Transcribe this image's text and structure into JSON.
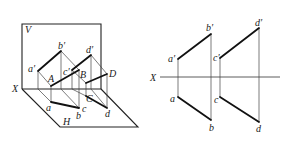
{
  "pictorial": {
    "plane_labels": {
      "V": "V",
      "H": "H",
      "X": "X"
    },
    "point_labels": {
      "a_prime": "a′",
      "b_prime": "b′",
      "c_prime": "c′",
      "d_prime": "d′",
      "A": "A",
      "B": "B",
      "C": "C",
      "D": "D",
      "a": "a",
      "b": "b",
      "c": "c",
      "d": "d"
    }
  },
  "orthographic": {
    "axis_label": "X",
    "point_labels": {
      "a_prime": "a′",
      "b_prime": "b′",
      "c_prime": "c′",
      "d_prime": "d′",
      "a": "a",
      "b": "b",
      "c": "c",
      "d": "d"
    }
  }
}
